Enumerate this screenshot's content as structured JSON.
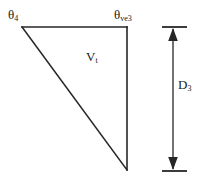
{
  "figure": {
    "background_color": "#ffffff",
    "stroke_color": "#262626",
    "text_color": "#1a1a1a",
    "width": 203,
    "height": 183
  },
  "labels": {
    "top_left": {
      "symbol": "θ",
      "subscript": "4",
      "name": "theta-4"
    },
    "top_right": {
      "symbol": "θ",
      "subscript": "ve3",
      "name": "theta-ve3"
    },
    "interior": {
      "symbol": "V",
      "subscript": "t",
      "name": "V-t"
    },
    "dimension": {
      "symbol": "D",
      "subscript": "3",
      "name": "D-3"
    }
  },
  "geometry": {
    "triangle": {
      "vertex_top_left": [
        22,
        27
      ],
      "vertex_top_right": [
        127,
        27
      ],
      "vertex_bottom_right": [
        127,
        170
      ],
      "sides": [
        "top-horizontal",
        "right-vertical",
        "hypotenuse"
      ]
    },
    "dimension_line": {
      "x": 173,
      "y_top": 27,
      "y_bottom": 170,
      "arrowheads": [
        "up",
        "down"
      ],
      "extension_line_top": {
        "x1": 162,
        "x2": 187,
        "y": 27
      },
      "extension_line_bottom": {
        "x1": 162,
        "x2": 187,
        "y": 171
      }
    }
  }
}
